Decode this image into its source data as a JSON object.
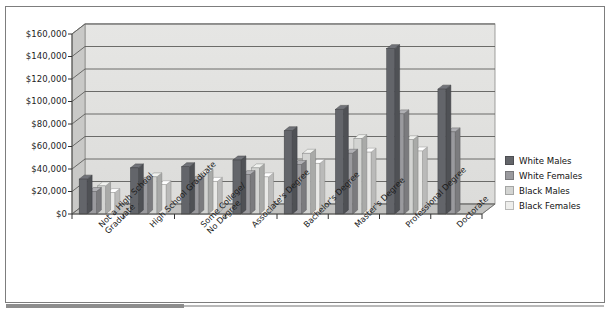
{
  "chart_data": {
    "type": "bar",
    "title": "",
    "subtitle": "",
    "xlabel": "",
    "ylabel": "",
    "ylim": [
      0,
      160000
    ],
    "ytick_step": 20000,
    "grid": true,
    "style": "3d-clustered-column",
    "legend_position": "right",
    "yticks": [
      "$0",
      "$20,000",
      "$40,000",
      "$60,000",
      "$80,000",
      "$100,000",
      "$120,000",
      "$140,000",
      "$160,000"
    ],
    "categories": [
      "Not a High School\nGraduate",
      "High School Graduate",
      "Some College/\nNo Degree",
      "Associate's Degree",
      "Bachelor's Degree",
      "Master's Degree",
      "Professional Degree",
      "Doctorate"
    ],
    "series": [
      {
        "name": "White Males",
        "color": "#63656a",
        "values": [
          31000,
          41000,
          42000,
          48000,
          74000,
          93000,
          147000,
          111000
        ]
      },
      {
        "name": "White Females",
        "color": "#9a9a9e",
        "values": [
          20000,
          29000,
          30000,
          35000,
          44000,
          54000,
          89000,
          73000
        ]
      },
      {
        "name": "Black Males",
        "color": "#d3d4d2",
        "values": [
          25000,
          33000,
          36000,
          41000,
          54000,
          67000,
          66000,
          0
        ]
      },
      {
        "name": "Black Females",
        "color": "#e9e9e7",
        "values": [
          19000,
          26000,
          29000,
          33000,
          45000,
          55000,
          56000,
          0
        ]
      }
    ]
  },
  "legend": {
    "items": [
      {
        "label": "White Males",
        "color": "#63656a"
      },
      {
        "label": "White Females",
        "color": "#9a9a9e"
      },
      {
        "label": "Black Males",
        "color": "#d3d4d2"
      },
      {
        "label": "Black Females",
        "color": "#eeeeec"
      }
    ]
  }
}
